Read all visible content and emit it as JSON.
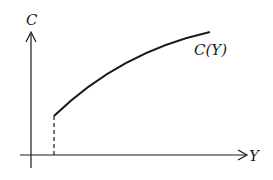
{
  "diagram": {
    "type": "function-graph",
    "y_axis_label": "C",
    "x_axis_label": "Y",
    "curve_label": "C(Y)",
    "curve": {
      "description": "increasing concave curve starting at a positive Y value with positive C",
      "start": [
        54,
        116
      ],
      "control": [
        120,
        50
      ],
      "end": [
        210,
        32
      ]
    },
    "dashed_drop": {
      "description": "dashed vertical line from curve start down to Y axis",
      "x": 54,
      "y_from": 116,
      "y_to": 155
    },
    "colors": {
      "line": "#1a1a1a",
      "background": "#ffffff"
    }
  }
}
